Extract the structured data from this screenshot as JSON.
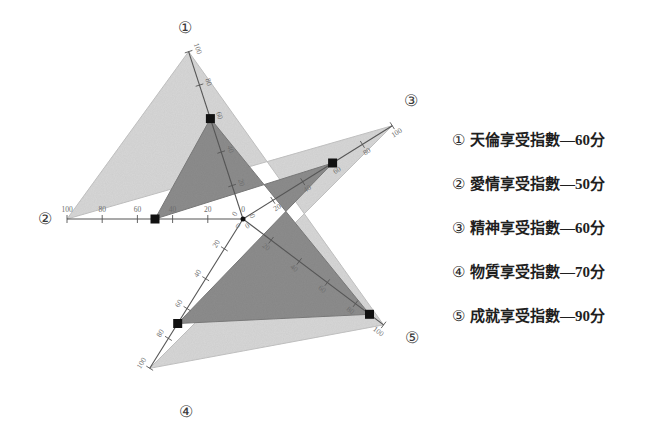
{
  "chart_data": {
    "type": "radar",
    "title": "",
    "categories": [
      "天倫享受指數",
      "愛情享受指數",
      "精神享受指數",
      "物質享受指數",
      "成就享受指數"
    ],
    "axis_numbers": [
      "①",
      "②",
      "③",
      "④",
      "⑤"
    ],
    "values": [
      60,
      50,
      60,
      70,
      90
    ],
    "rmax": 100,
    "rmin": 0,
    "tick_values": [
      0,
      20,
      40,
      60,
      80,
      100
    ],
    "tick_labels": [
      "0",
      "20",
      "40",
      "60",
      "80",
      "100"
    ],
    "unit": "分",
    "grid": false,
    "legend_position": "right",
    "colors": {
      "outer_polygon_fill": "#d6d6d6",
      "data_polygon_fill": "#8c8c8c",
      "axis_line": "#555555",
      "marker": "#111111",
      "tick_text": "#6d6d6d"
    },
    "axis_angles_deg": [
      -108,
      180,
      -32,
      122,
      37
    ]
  },
  "legend": {
    "items": [
      {
        "marker": "①",
        "label": "天倫享受指數—60分"
      },
      {
        "marker": "②",
        "label": "愛情享受指數—50分"
      },
      {
        "marker": "③",
        "label": "精神享受指數—60分"
      },
      {
        "marker": "④",
        "label": "物質享受指數—70分"
      },
      {
        "marker": "⑤",
        "label": "成就享受指數—90分"
      }
    ]
  },
  "axis_markers": {
    "a1": "①",
    "a2": "②",
    "a3": "③",
    "a4": "④",
    "a5": "⑤"
  }
}
